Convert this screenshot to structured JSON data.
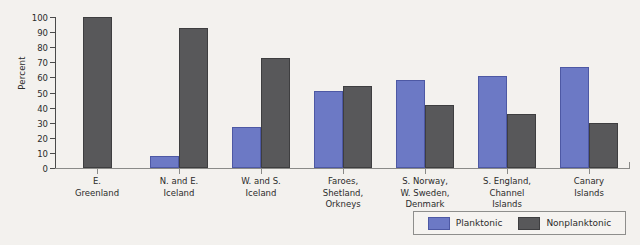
{
  "chart_data": {
    "type": "bar",
    "title": "",
    "xlabel": "",
    "ylabel": "Percent",
    "ylim": [
      0,
      100
    ],
    "ytick_step": 10,
    "yticks": [
      100,
      90,
      80,
      70,
      60,
      50,
      40,
      30,
      20,
      10,
      0
    ],
    "grid": false,
    "legend_position": "bottom-right",
    "categories": [
      "E.\nGreenland",
      "N. and E.\nIceland",
      "W. and S.\nIceland",
      "Faroes,\nShetland,\nOrkneys",
      "S. Norway,\nW. Sweden,\nDenmark",
      "S. England,\nChannel\nIslands",
      "Canary\nIslands"
    ],
    "series": [
      {
        "name": "Planktonic",
        "color": "#6c79c5",
        "values": [
          0,
          8,
          27,
          51,
          58,
          61,
          67
        ]
      },
      {
        "name": "Nonplanktonic",
        "color": "#58585a",
        "values": [
          100,
          93,
          73,
          54,
          42,
          36,
          30
        ]
      }
    ]
  },
  "axes": {
    "y_title": "Percent"
  },
  "legend": {
    "items": [
      {
        "label": "Planktonic",
        "color": "#6c79c5"
      },
      {
        "label": "Nonplanktonic",
        "color": "#58585a"
      }
    ]
  },
  "categories_display": [
    [
      "E.",
      "Greenland"
    ],
    [
      "N. and E.",
      "Iceland"
    ],
    [
      "W. and S.",
      "Iceland"
    ],
    [
      "Faroes,",
      "Shetland,",
      "Orkneys"
    ],
    [
      "S. Norway,",
      "W. Sweden,",
      "Denmark"
    ],
    [
      "S. England,",
      "Channel",
      "Islands"
    ],
    [
      "Canary",
      "Islands"
    ]
  ]
}
